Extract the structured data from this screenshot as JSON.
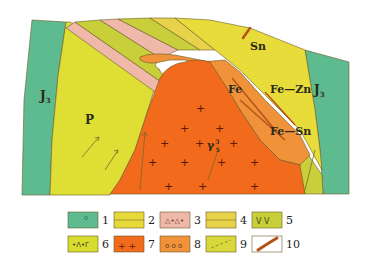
{
  "diagram": {
    "type": "geological-map",
    "labels": {
      "j3_left": "J",
      "j3_left_sub": "3",
      "j3_right": "J",
      "j3_right_sub": "3",
      "p": "P",
      "sn": "Sn",
      "fe": "Fe",
      "fe_zn": "Fe—Zn",
      "fe_sn": "Fe—Sn",
      "gamma": "γ",
      "gamma_sup": "3",
      "gamma_sub": "5"
    },
    "colors": {
      "teal_volcanic": "#5dbb8f",
      "yellow_sandstone": "#e6d93a",
      "pink_breccia": "#f0b8a8",
      "olive_limestone": "#d8cc3a",
      "green_andesite": "#c9cf3a",
      "yellow_tuff": "#d8dc2e",
      "granite_orange": "#f26a1b",
      "skarn_orange": "#f0923a",
      "outline": "#6b5a2a"
    }
  },
  "legend": {
    "items": [
      {
        "num": "1",
        "pattern": "teal-circles"
      },
      {
        "num": "2",
        "pattern": "yellow-dots"
      },
      {
        "num": "3",
        "pattern": "pink-triangles"
      },
      {
        "num": "4",
        "pattern": "yellow-bricks"
      },
      {
        "num": "5",
        "pattern": "yellow-v"
      },
      {
        "num": "6",
        "pattern": "yellow-lambda"
      },
      {
        "num": "7",
        "pattern": "orange-crosses"
      },
      {
        "num": "8",
        "pattern": "orange-circles"
      },
      {
        "num": "9",
        "pattern": "yellow-dashes"
      },
      {
        "num": "10",
        "pattern": "orebody-lens"
      }
    ]
  }
}
